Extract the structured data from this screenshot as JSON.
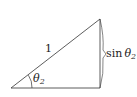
{
  "diagram": {
    "type": "right-triangle",
    "hypotenuse_label": "1",
    "angle_label": {
      "symbol": "θ",
      "subscript": "2"
    },
    "opposite_label": {
      "func": "sin",
      "symbol": "θ",
      "subscript": "2"
    },
    "stroke_color": "#333333"
  }
}
